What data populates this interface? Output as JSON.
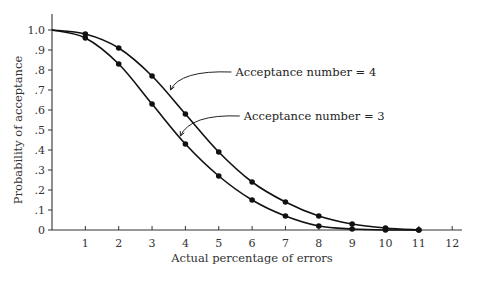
{
  "chart_data": {
    "type": "line",
    "title": "",
    "xlabel": "Actual percentage of errors",
    "ylabel": "Probability of acceptance",
    "xlim": [
      0,
      12.3
    ],
    "ylim": [
      0,
      1.05
    ],
    "grid": false,
    "legend": "none (inline annotations)",
    "x_ticks": [
      1,
      2,
      3,
      4,
      5,
      6,
      7,
      8,
      9,
      10,
      11,
      12
    ],
    "x_tick_labels": [
      "1",
      "2",
      "3",
      "4",
      "5",
      "6",
      "7",
      "8",
      "9",
      "10",
      "11",
      "12"
    ],
    "y_ticks": [
      0,
      0.1,
      0.2,
      0.3,
      0.4,
      0.5,
      0.6,
      0.7,
      0.8,
      0.9,
      1.0
    ],
    "y_tick_labels": [
      "0",
      ".1",
      ".2",
      ".3",
      ".4",
      ".5",
      ".6",
      ".7",
      ".8",
      ".9",
      "1.0"
    ],
    "x": [
      0,
      1,
      2,
      3,
      4,
      5,
      6,
      7,
      8,
      9,
      10,
      11
    ],
    "series": [
      {
        "name": "Acceptance number = 4",
        "values": [
          1.0,
          0.98,
          0.91,
          0.77,
          0.58,
          0.39,
          0.24,
          0.14,
          0.07,
          0.03,
          0.01,
          0.0
        ],
        "markers_at": [
          1,
          2,
          3,
          4,
          5,
          6,
          7,
          8,
          9,
          10,
          11
        ]
      },
      {
        "name": "Acceptance number = 3",
        "values": [
          1.0,
          0.96,
          0.83,
          0.63,
          0.43,
          0.27,
          0.15,
          0.07,
          0.02,
          0.005,
          0.0,
          0.0
        ],
        "markers_at": [
          1,
          2,
          3,
          4,
          5,
          6,
          7,
          8,
          9,
          10,
          11
        ]
      }
    ],
    "annotations": [
      {
        "text": "Acceptance number = 4",
        "series": 0,
        "label_at": [
          5.5,
          0.77
        ],
        "arrow_to": [
          3.55,
          0.7
        ]
      },
      {
        "text": "Acceptance number = 3",
        "series": 1,
        "label_at": [
          5.75,
          0.55
        ],
        "arrow_to": [
          3.85,
          0.47
        ]
      }
    ]
  },
  "layout": {
    "plot_origin_px": [
      52,
      230
    ],
    "px_per_x_unit": 33.35,
    "px_per_y_unit": 200,
    "x_axis_end_px": 462,
    "y_axis_top_px": 14
  }
}
